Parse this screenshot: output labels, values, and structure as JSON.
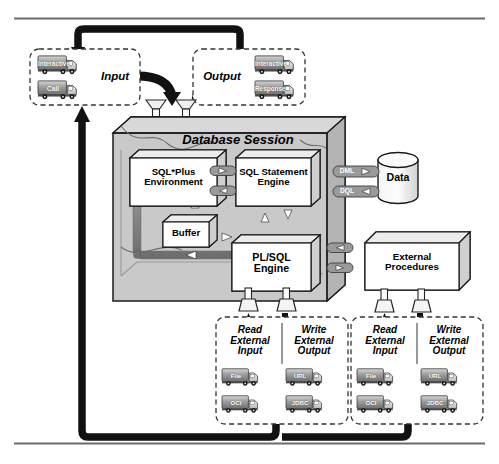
{
  "figure": {
    "rules": {
      "top_y": 18,
      "bottom_y": 443
    }
  },
  "colors": {
    "page_bg": "#ffffff",
    "rule": "#6b6b6b",
    "flow_black": "#111111",
    "session_fill": "#c9c9c9",
    "session_top": "#d8d8d8",
    "session_side": "#b4b4b4",
    "pipe": "#8a8a8a",
    "pipe_edge": "#5a5a5a",
    "box_fill": "#ffffff",
    "box_top": "#ececec",
    "box_side": "#cfcfcf",
    "stroke": "#1a1a1a",
    "dashed": "#333333",
    "truck_body": "#9c9c9c",
    "truck_cab": "#e8e8e8",
    "connector": "#9a9a9a"
  },
  "input_panel": {
    "name": "Input",
    "label": "Input",
    "trucks": [
      {
        "label": "Interactive"
      },
      {
        "label": "Call"
      }
    ]
  },
  "output_panel": {
    "name": "Output",
    "label": "Output",
    "trucks": [
      {
        "label": "Interactive"
      },
      {
        "label": "Response"
      }
    ]
  },
  "session": {
    "title": "Database Session",
    "components": [
      {
        "id": "sqlplus",
        "label": "SQL*Plus\nEnvironment"
      },
      {
        "id": "sqlstmt",
        "label": "SQL Statement\nEngine"
      },
      {
        "id": "buffer",
        "label": "Buffer"
      },
      {
        "id": "plsql",
        "label": "PL/SQL\nEngine"
      }
    ]
  },
  "data_store": {
    "label": "Data",
    "channels": [
      {
        "label": "DML",
        "direction": "right"
      },
      {
        "label": "DQL",
        "direction": "left"
      }
    ]
  },
  "external_procedures": {
    "label": "External\nProcedures"
  },
  "io_panels": [
    {
      "id": "io-left",
      "columns": [
        {
          "label": "Read\nExternal\nInput",
          "trucks": [
            {
              "label": "File"
            },
            {
              "label": "OCI"
            }
          ]
        },
        {
          "label": "Write\nExternal\nOutput",
          "trucks": [
            {
              "label": "URL"
            },
            {
              "label": "JDBC"
            }
          ]
        }
      ]
    },
    {
      "id": "io-right",
      "columns": [
        {
          "label": "Read\nExternal\nInput",
          "trucks": [
            {
              "label": "File"
            },
            {
              "label": "OCI"
            }
          ]
        },
        {
          "label": "Write\nExternal\nOutput",
          "trucks": [
            {
              "label": "URL"
            },
            {
              "label": "JDBC"
            }
          ]
        }
      ]
    }
  ]
}
